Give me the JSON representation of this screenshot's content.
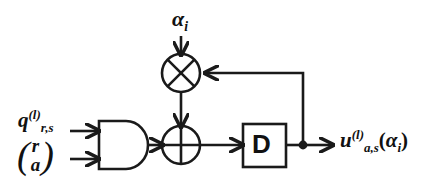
{
  "figure": {
    "stroke_color": "#1a1a1a",
    "background_color": "#ffffff"
  },
  "labels": {
    "alpha_input": {
      "base": "α",
      "subscript": "i",
      "full": "αᵢ"
    },
    "q_input": {
      "base": "q",
      "subscript": "r,s",
      "superscript": "(l)",
      "full": "q_{r,s}^{(l)}"
    },
    "vector_input": {
      "open_paren": "(",
      "top": "r",
      "bottom": "a",
      "close_paren": ")",
      "full": "(r a)"
    },
    "delay_block": {
      "text": "D"
    },
    "output": {
      "base": "u",
      "subscript": "a,s",
      "superscript": "(l)",
      "arg_open": "(",
      "arg_base": "α",
      "arg_subscript": "i",
      "arg_close": ")",
      "full": "u_{a,s}^{(l)}(αᵢ)"
    }
  },
  "nodes": {
    "and_gate": {
      "name": "AND gate",
      "symbol": "and"
    },
    "multiplier": {
      "name": "Multiplier",
      "symbol": "circle-x"
    },
    "adder": {
      "name": "Modulo-2 adder / XOR",
      "symbol": "circle-plus"
    },
    "delay": {
      "name": "Delay element",
      "symbol": "box-D"
    },
    "junction": {
      "name": "Feedback tap junction",
      "symbol": "dot"
    }
  },
  "connections": [
    {
      "from": "q_input",
      "to": "and_gate",
      "name": "q-to-and"
    },
    {
      "from": "vector_input",
      "to": "and_gate",
      "name": "vector-to-and"
    },
    {
      "from": "and_gate",
      "to": "adder",
      "name": "and-to-adder"
    },
    {
      "from": "alpha_input",
      "to": "multiplier",
      "name": "alpha-to-multiplier"
    },
    {
      "from": "multiplier",
      "to": "adder",
      "name": "multiplier-to-adder"
    },
    {
      "from": "adder",
      "to": "delay",
      "name": "adder-to-delay"
    },
    {
      "from": "delay",
      "to": "junction",
      "name": "delay-to-junction"
    },
    {
      "from": "junction",
      "to": "output",
      "name": "junction-to-output"
    },
    {
      "from": "junction",
      "to": "multiplier",
      "name": "feedback-to-multiplier"
    }
  ]
}
